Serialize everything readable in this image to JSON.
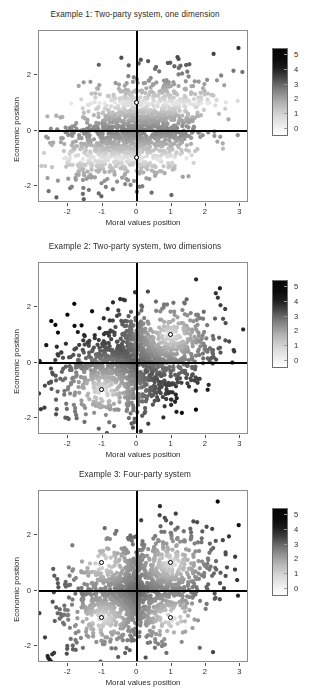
{
  "figure": {
    "panel_count": 3,
    "background": "#ffffff",
    "marker_fill": "#ffffff",
    "marker_stroke": "#000000",
    "reference_line_color": "#000000",
    "frame_color": "#8c8c8c"
  },
  "axes": {
    "xlabel": "Moral values position",
    "ylabel": "Economic position",
    "xticks": [
      "-2",
      "-1",
      "0",
      "1",
      "2",
      "3"
    ],
    "xtick_values": [
      -2,
      -1,
      0,
      1,
      2,
      3
    ],
    "yticks": [
      "-2",
      "0",
      "2"
    ],
    "ytick_values": [
      -2,
      0,
      2
    ],
    "xlim": [
      -2.85,
      3.25
    ],
    "ylim": [
      -2.6,
      3.6
    ]
  },
  "colorbar": {
    "ticks": [
      "5",
      "4",
      "3",
      "2",
      "1",
      "0"
    ],
    "tick_values": [
      5,
      4,
      3,
      2,
      1,
      0
    ],
    "low_color": "#ffffff",
    "high_color": "#050505",
    "orientation": "vertical"
  },
  "panels": [
    {
      "id": "panel-1",
      "title": "Example 1: Two-party system, one dimension",
      "party_positions": [
        {
          "x": 0,
          "y": 1
        },
        {
          "x": 0,
          "y": -1
        }
      ]
    },
    {
      "id": "panel-2",
      "title": "Example 2: Two-party system, two dimensions",
      "party_positions": [
        {
          "x": 1,
          "y": 1
        },
        {
          "x": -1,
          "y": -1
        }
      ]
    },
    {
      "id": "panel-3",
      "title": "Example 3: Four-party system",
      "party_positions": [
        {
          "x": -1,
          "y": 1
        },
        {
          "x": 1,
          "y": 1
        },
        {
          "x": -1,
          "y": -1
        },
        {
          "x": 1,
          "y": -1
        }
      ]
    }
  ],
  "chart_data": {
    "type": "scatter",
    "xlabel": "Moral values position",
    "ylabel": "Economic position",
    "xlim": [
      -2.85,
      3.25
    ],
    "ylim": [
      -2.6,
      3.6
    ],
    "grid": false,
    "legend": {
      "position": "right",
      "type": "colorbar",
      "label": "",
      "ticks": [
        0,
        1,
        2,
        3,
        4,
        5
      ],
      "range": [
        0,
        5.6
      ],
      "colormap": "grayscale (white = low, black = high)"
    },
    "n_points_per_panel": 1400,
    "point_radius_px": 2.1,
    "reference_lines": {
      "vertical_x": 0,
      "horizontal_y": 0
    },
    "series": [
      {
        "name": "Example 1: Two-party system, one dimension",
        "panel": 1,
        "distribution": "bivariate normal cloud centered near (0,0), sd_x 1.05, sd_y 0.95, correlation 0.35",
        "color_encoding": "distance to nearest party position (vertical dimension only)",
        "party_positions": [
          [
            0,
            1
          ],
          [
            0,
            -1
          ]
        ]
      },
      {
        "name": "Example 2: Two-party system, two dimensions",
        "panel": 2,
        "distribution": "bivariate normal cloud centered near (0,0), sd_x 1.05, sd_y 0.95, correlation 0.35",
        "color_encoding": "distance to nearest party position (both dimensions)",
        "party_positions": [
          [
            1,
            1
          ],
          [
            -1,
            -1
          ]
        ]
      },
      {
        "name": "Example 3: Four-party system",
        "panel": 3,
        "distribution": "bivariate normal cloud centered near (0,0), sd_x 1.05, sd_y 0.95, correlation 0.35",
        "color_encoding": "distance to nearest of four party positions",
        "party_positions": [
          [
            -1,
            1
          ],
          [
            1,
            1
          ],
          [
            -1,
            -1
          ],
          [
            1,
            -1
          ]
        ]
      }
    ]
  }
}
